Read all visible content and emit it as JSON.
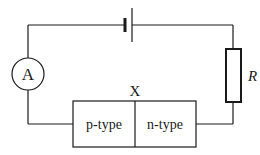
{
  "diagram": {
    "type": "circuit",
    "components": {
      "cell": {
        "name": "cell"
      },
      "ammeter": {
        "label": "A"
      },
      "resistor": {
        "label": "R"
      },
      "junction": {
        "label": "X",
        "left_region": "p-type",
        "right_region": "n-type"
      }
    },
    "colors": {
      "stroke": "#1a1a1a",
      "background": "#ffffff"
    }
  }
}
